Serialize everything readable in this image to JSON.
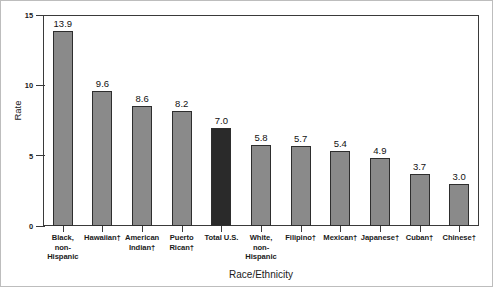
{
  "chart_data": {
    "type": "bar",
    "title": "",
    "subtitle": "",
    "xlabel": "Race/Ethnicity",
    "ylabel": "Rate",
    "ylim": [
      0,
      15
    ],
    "yticks": [
      0,
      5,
      10,
      15
    ],
    "ytick_labels": [
      "0",
      "5",
      "10",
      "15"
    ],
    "grid": false,
    "legend": "none",
    "categories": [
      "Black,\nnon-\nHispanic",
      "Hawaiian†",
      "American\nIndian†",
      "Puerto\nRican†",
      "Total U.S.",
      "White,\nnon-\nHispanic",
      "Filipino†",
      "Mexican†",
      "Japanese†",
      "Cuban†",
      "Chinese†"
    ],
    "values": [
      13.9,
      9.6,
      8.6,
      8.2,
      7.0,
      5.8,
      5.7,
      5.4,
      4.9,
      3.7,
      3.0
    ],
    "value_labels": [
      "13.9",
      "9.6",
      "8.6",
      "8.2",
      "7.0",
      "5.8",
      "5.7",
      "5.4",
      "4.9",
      "3.7",
      "3.0"
    ],
    "bar_colors": [
      "#8a8a8a",
      "#8a8a8a",
      "#8a8a8a",
      "#8a8a8a",
      "#2a2a2a",
      "#8a8a8a",
      "#8a8a8a",
      "#8a8a8a",
      "#8a8a8a",
      "#8a8a8a",
      "#8a8a8a"
    ],
    "bar_edge_color": "#2e2e2e",
    "highlight_index": 4,
    "highlight_color": "#2a2a2a",
    "series_color": "#8a8a8a",
    "axis_color": "#3a3a3a",
    "background": "#ffffff"
  }
}
